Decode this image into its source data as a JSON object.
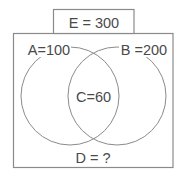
{
  "diagram": {
    "type": "venn",
    "universe": {
      "label": "E = 300",
      "name": "E",
      "value": 300
    },
    "sets": [
      {
        "name": "A",
        "label": "A=100",
        "value": 100
      },
      {
        "name": "B",
        "label": "B =200",
        "value": 200
      }
    ],
    "intersection": {
      "name": "C",
      "label": "C=60",
      "value": 60
    },
    "outside": {
      "name": "D",
      "label": "D = ?",
      "value": "?"
    },
    "colors": {
      "line": "#8a8a8a",
      "text": "#4a4a4a",
      "background": "#ffffff"
    }
  }
}
